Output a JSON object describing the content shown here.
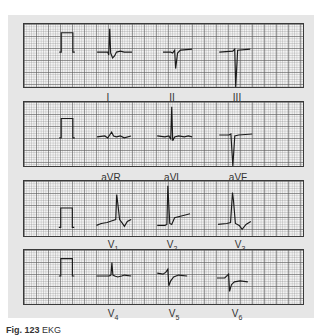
{
  "figure": {
    "caption_label": "Fig. 123",
    "caption_text": "EKG"
  },
  "strips": [
    {
      "id": "limb-leads",
      "labels": [
        "I",
        "II",
        "III"
      ]
    },
    {
      "id": "augmented-leads",
      "labels": [
        "aVR",
        "aVL",
        "aVF"
      ]
    },
    {
      "id": "precordial-leads-1",
      "labels": [
        "V",
        "V",
        "V"
      ],
      "subscripts": [
        "1",
        "2",
        "3"
      ]
    },
    {
      "id": "precordial-leads-2",
      "labels": [
        "V",
        "V",
        "V"
      ],
      "subscripts": [
        "4",
        "5",
        "6"
      ]
    }
  ],
  "colors": {
    "trace": "#1a1a1a",
    "grid_bg": "#f4f4f4",
    "panel_bg": "#e6e6e6",
    "border": "#3a3a3a"
  }
}
